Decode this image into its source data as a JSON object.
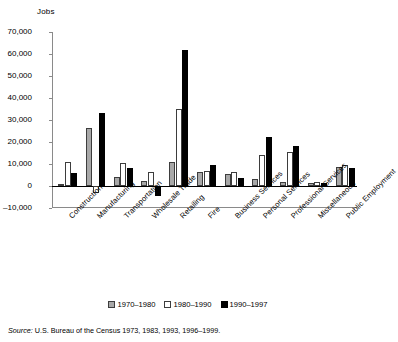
{
  "chart_data": {
    "type": "bar",
    "title": "",
    "ylabel": "Jobs",
    "xlabel": "",
    "ylim": [
      -10000,
      70000
    ],
    "ytick_step": 10000,
    "yticks": [
      "70,000",
      "60,000",
      "50,000",
      "40,000",
      "30,000",
      "20,000",
      "10,000",
      "0",
      "–10,000"
    ],
    "ytick_values": [
      70000,
      60000,
      50000,
      40000,
      30000,
      20000,
      10000,
      0,
      -10000
    ],
    "grid": false,
    "legend_position": "bottom-center",
    "categories": [
      "Construction",
      "Manufacturing",
      "Transportation",
      "Wholesale Trade",
      "Retailing",
      "Fire",
      "Business Services",
      "Personal Services",
      "Professional Services",
      "Miscellaneous",
      "Public Employment"
    ],
    "series": [
      {
        "name": "1970–1980",
        "color": "#a8a8a8",
        "values": [
          700,
          26500,
          4000,
          2500,
          11000,
          6500,
          5500,
          3000,
          2000,
          1500,
          8500
        ]
      },
      {
        "name": "1980–1990",
        "color": "#ffffff",
        "values": [
          11000,
          -3000,
          10500,
          6500,
          35000,
          7000,
          6500,
          14000,
          15500,
          1700,
          9500
        ]
      },
      {
        "name": "1990–1997",
        "color": "#000000",
        "values": [
          6000,
          33000,
          8000,
          -4500,
          62000,
          9500,
          3500,
          22500,
          18000,
          1500,
          8000
        ]
      }
    ]
  },
  "source": {
    "label": "Source:",
    "text": " U.S. Bureau of the Census 1973, 1983, 1993, 1996–1999."
  }
}
